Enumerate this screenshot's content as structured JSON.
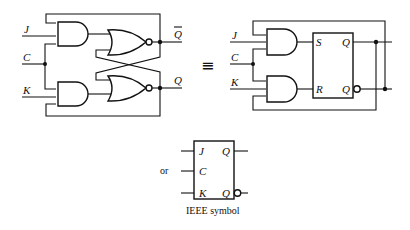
{
  "left_circuit": {
    "inputs": {
      "j": "J",
      "c": "C",
      "k": "K"
    },
    "outputs": {
      "q_bar": "Q",
      "q": "Q"
    },
    "gates": [
      "AND",
      "AND",
      "NOR",
      "NOR"
    ]
  },
  "equivalence_symbol": "≡",
  "right_circuit": {
    "inputs": {
      "j": "J",
      "c": "C",
      "k": "K"
    },
    "box": {
      "s": "S",
      "r": "R",
      "q": "Q",
      "q_bar": "Q"
    },
    "gates": [
      "AND",
      "AND"
    ]
  },
  "ieee": {
    "or_label": "or",
    "pins": {
      "j": "J",
      "c": "C",
      "k": "K",
      "q": "Q",
      "q_bar": "Q"
    },
    "caption": "IEEE symbol"
  }
}
